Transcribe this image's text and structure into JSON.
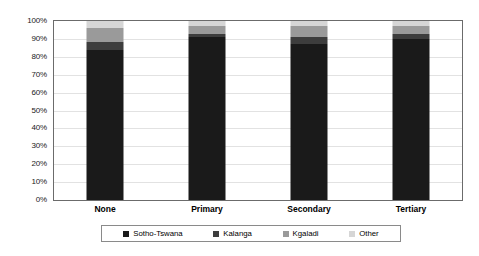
{
  "chart_data": {
    "type": "bar",
    "subtype": "100% stacked column",
    "title": "",
    "xlabel": "",
    "ylabel": "",
    "ylim": [
      0,
      100
    ],
    "ytick_labels": [
      "100%",
      "90%",
      "80%",
      "70%",
      "60%",
      "50%",
      "40%",
      "30%",
      "20%",
      "10%",
      "0%"
    ],
    "ytick_values": [
      100,
      90,
      80,
      70,
      60,
      50,
      40,
      30,
      20,
      10,
      0
    ],
    "grid": true,
    "legend_position": "bottom",
    "categories": [
      "None",
      "Primary",
      "Secondary",
      "Tertiary"
    ],
    "series": [
      {
        "name": "Sotho-Tswana",
        "color": "#1a1a1a",
        "values": [
          84,
          91,
          87,
          90
        ]
      },
      {
        "name": "Kalanga",
        "color": "#3d3d3d",
        "values": [
          4,
          2,
          4,
          3
        ]
      },
      {
        "name": "Kgaladi",
        "color": "#9a9a9a",
        "values": [
          8,
          4,
          6,
          4
        ]
      },
      {
        "name": "Other",
        "color": "#d6d6d6",
        "values": [
          4,
          3,
          3,
          3
        ]
      }
    ]
  },
  "axis": {
    "ticks": [
      {
        "label": "100%",
        "value": 100
      },
      {
        "label": "90%",
        "value": 90
      },
      {
        "label": "80%",
        "value": 80
      },
      {
        "label": "70%",
        "value": 70
      },
      {
        "label": "60%",
        "value": 60
      },
      {
        "label": "50%",
        "value": 50
      },
      {
        "label": "40%",
        "value": 40
      },
      {
        "label": "30%",
        "value": 30
      },
      {
        "label": "20%",
        "value": 20
      },
      {
        "label": "10%",
        "value": 10
      },
      {
        "label": "0%",
        "value": 0
      }
    ]
  },
  "categories": [
    {
      "label": "None"
    },
    {
      "label": "Primary"
    },
    {
      "label": "Secondary"
    },
    {
      "label": "Tertiary"
    }
  ],
  "legend": {
    "items": [
      {
        "label": "Sotho-Tswana",
        "color": "#1a1a1a"
      },
      {
        "label": "Kalanga",
        "color": "#3d3d3d"
      },
      {
        "label": "Kgaladi",
        "color": "#9a9a9a"
      },
      {
        "label": "Other",
        "color": "#d6d6d6"
      }
    ]
  }
}
